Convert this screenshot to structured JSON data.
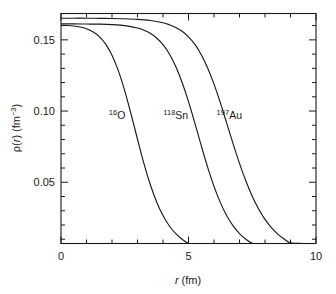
{
  "chart_data": {
    "type": "line",
    "title": "",
    "xlabel": "r (fm)",
    "ylabel": "ρ(r) (fm⁻³)",
    "xlim": [
      0,
      10
    ],
    "ylim": [
      0.007,
      0.1685
    ],
    "grid": false,
    "legend_position": "inline-annotations",
    "xticks_major": [
      0,
      5,
      10
    ],
    "xtick_labels": [
      "0",
      "5",
      "10"
    ],
    "xticks_minor": [
      1,
      2,
      3,
      4,
      6,
      7,
      8,
      9
    ],
    "yticks_major": [
      0.05,
      0.1,
      0.15
    ],
    "ytick_labels": [
      "0.05",
      "0.10",
      "0.15"
    ],
    "yticks_minor": [
      0.01,
      0.02,
      0.03,
      0.04,
      0.06,
      0.07,
      0.08,
      0.09,
      0.11,
      0.12,
      0.13,
      0.14,
      0.16
    ],
    "model": "Woods-Saxon / two-parameter Fermi distribution",
    "series": [
      {
        "name": "16O",
        "label_mass": "16",
        "label_symbol": "O",
        "rho0": 0.161,
        "half_density_radius": 2.61,
        "surface_diffuseness": 0.513,
        "label_x": 2.2,
        "label_y": 0.0945,
        "x": [
          0.0,
          0.25,
          0.5,
          0.75,
          1.0,
          1.25,
          1.5,
          1.75,
          2.0,
          2.25,
          2.5,
          2.75,
          3.0,
          3.25,
          3.5,
          3.75,
          4.0,
          4.25,
          4.5,
          4.75,
          5.0,
          5.25,
          5.5,
          5.75,
          6.0,
          6.5,
          7.0,
          7.5,
          8.0,
          9.0,
          10.0
        ],
        "y": [
          0.1602,
          0.1601,
          0.1597,
          0.159,
          0.1578,
          0.1557,
          0.1523,
          0.147,
          0.1391,
          0.1282,
          0.1142,
          0.0977,
          0.0802,
          0.0633,
          0.0484,
          0.0362,
          0.0266,
          0.0193,
          0.0139,
          0.01,
          0.0071,
          0.0051,
          0.0036,
          0.0026,
          0.0018,
          0.0009,
          0.0005,
          0.0002,
          0.0001,
          0.0,
          0.0
        ]
      },
      {
        "name": "118Sn",
        "label_mass": "118",
        "label_symbol": "Sn",
        "rho0": 0.1612,
        "half_density_radius": 5.37,
        "surface_diffuseness": 0.525,
        "label_x": 4.5,
        "label_y": 0.0945,
        "x": [
          0.0,
          0.5,
          1.0,
          1.5,
          2.0,
          2.5,
          3.0,
          3.25,
          3.5,
          3.75,
          4.0,
          4.25,
          4.5,
          4.75,
          5.0,
          5.25,
          5.5,
          5.75,
          6.0,
          6.25,
          6.5,
          6.75,
          7.0,
          7.25,
          7.5,
          7.75,
          8.0,
          8.5,
          9.0,
          9.5,
          10.0
        ],
        "y": [
          0.1612,
          0.1612,
          0.1611,
          0.161,
          0.1607,
          0.16,
          0.1583,
          0.1568,
          0.1546,
          0.1513,
          0.1466,
          0.1401,
          0.1313,
          0.1201,
          0.1066,
          0.0915,
          0.0757,
          0.0606,
          0.0471,
          0.0357,
          0.0265,
          0.0194,
          0.014,
          0.01,
          0.0071,
          0.005,
          0.0036,
          0.0018,
          0.0009,
          0.0004,
          0.0002
        ]
      },
      {
        "name": "197Au",
        "label_mass": "197",
        "label_symbol": "Au",
        "rho0": 0.1652,
        "half_density_radius": 6.55,
        "surface_diffuseness": 0.535,
        "label_x": 6.6,
        "label_y": 0.0945,
        "x": [
          0.0,
          0.5,
          1.0,
          1.5,
          2.0,
          2.5,
          3.0,
          3.5,
          4.0,
          4.25,
          4.5,
          4.75,
          5.0,
          5.25,
          5.5,
          5.75,
          6.0,
          6.25,
          6.5,
          6.75,
          7.0,
          7.25,
          7.5,
          7.75,
          8.0,
          8.25,
          8.5,
          8.75,
          9.0,
          9.5,
          10.0
        ],
        "y": [
          0.1652,
          0.1652,
          0.1652,
          0.1651,
          0.165,
          0.1648,
          0.1644,
          0.1636,
          0.162,
          0.1606,
          0.1587,
          0.156,
          0.1521,
          0.1468,
          0.1396,
          0.1303,
          0.1189,
          0.1057,
          0.0914,
          0.077,
          0.0633,
          0.0509,
          0.0402,
          0.0312,
          0.0239,
          0.0181,
          0.0136,
          0.0101,
          0.0075,
          0.0041,
          0.0022
        ]
      }
    ]
  },
  "axes": {
    "x_axis_label_italic": "r",
    "x_axis_label_unit": "(fm)",
    "y_axis_label_rho": "ρ",
    "y_axis_label_r": "r",
    "y_axis_label_unit_base": "(fm",
    "y_axis_label_unit_exp": "−3",
    "y_axis_label_unit_close": ")"
  }
}
